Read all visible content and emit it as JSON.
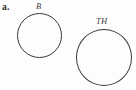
{
  "figure": {
    "part_label": "a.",
    "background_color": "#fdfdfd",
    "stroke_color": "#3a3a3a",
    "text_color": "#2e2e2e",
    "width": 136,
    "height": 90
  },
  "shapes": [
    {
      "name": "circle-b",
      "kind": "circle",
      "label": "B",
      "label_position": "above",
      "center_x": 39.5,
      "center_y": 35,
      "diameter": 45,
      "radius": 22.5,
      "stroke_color": "#3a3a3a",
      "stroke_width": 1,
      "fill": "none"
    },
    {
      "name": "circle-th",
      "kind": "circle",
      "label": "TH",
      "label_position": "above",
      "center_x": 104,
      "center_y": 57.5,
      "diameter": 56,
      "radius": 28,
      "stroke_color": "#3a3a3a",
      "stroke_width": 1,
      "fill": "none"
    }
  ]
}
